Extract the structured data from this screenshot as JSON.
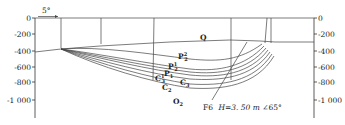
{
  "figure": {
    "type": "geological cross-section",
    "left_axis": {
      "ticks": [
        {
          "value": 0,
          "label": "0",
          "y": 18
        },
        {
          "value": -200,
          "label": "-200",
          "y": 34
        },
        {
          "value": -400,
          "label": "-400",
          "y": 51
        },
        {
          "value": -600,
          "label": "-600",
          "y": 67
        },
        {
          "value": -800,
          "label": "-800",
          "y": 82
        },
        {
          "value": -1000,
          "label": "-1 000",
          "y": 100
        }
      ]
    },
    "right_axis": {
      "ticks": [
        {
          "value": 0,
          "label": "0",
          "y": 18
        },
        {
          "value": -200,
          "label": "-200",
          "y": 34
        },
        {
          "value": -400,
          "label": "-400",
          "y": 51
        },
        {
          "value": -600,
          "label": "-600",
          "y": 67
        },
        {
          "value": -800,
          "label": "-800",
          "y": 82
        },
        {
          "value": -1000,
          "label": "-1 000",
          "y": 100
        }
      ]
    },
    "dip_indicator": "5°",
    "boreholes_x": [
      61,
      101,
      154,
      231,
      267,
      271
    ],
    "layers": [
      {
        "id": "Q",
        "main": "Q",
        "sup": "",
        "sub": ""
      },
      {
        "id": "P22",
        "main": "P",
        "sup": "2",
        "sub": "2"
      },
      {
        "id": "P21",
        "main": "P",
        "sup": "1",
        "sub": "2"
      },
      {
        "id": "P1",
        "main": "P",
        "sup": "",
        "sub": "1"
      },
      {
        "id": "C31",
        "main": "C",
        "sup": "1",
        "sub": "3"
      },
      {
        "id": "C32",
        "main": "C",
        "sup": "",
        "sub": "3"
      },
      {
        "id": "C2",
        "main": "C",
        "sup": "",
        "sub": "2"
      },
      {
        "id": "O2",
        "main": "O",
        "sup": "",
        "sub": "2"
      }
    ],
    "fault": {
      "name": "F6",
      "throw_label": "H=3. 50 m",
      "dip_label": "∠65°"
    }
  }
}
